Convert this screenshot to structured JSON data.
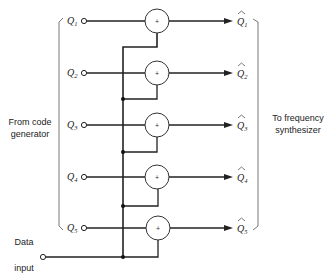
{
  "diagram": {
    "left_caption": {
      "line1": "From code",
      "line2": "generator"
    },
    "right_caption": {
      "line1": "To frequency",
      "line2": "synthesizer"
    },
    "data_input": {
      "line1": "Data",
      "line2": "input"
    },
    "adder_symbol": "+",
    "inputs": [
      {
        "base": "Q",
        "sub": "1"
      },
      {
        "base": "Q",
        "sub": "2"
      },
      {
        "base": "Q",
        "sub": "3"
      },
      {
        "base": "Q",
        "sub": "4"
      },
      {
        "base": "Q",
        "sub": "5"
      }
    ],
    "outputs": [
      {
        "base": "Q",
        "sub": "1",
        "hat": "^"
      },
      {
        "base": "Q",
        "sub": "2",
        "hat": "^"
      },
      {
        "base": "Q",
        "sub": "3",
        "hat": "^"
      },
      {
        "base": "Q",
        "sub": "4",
        "hat": "^"
      },
      {
        "base": "Q",
        "sub": "5",
        "hat": "^"
      }
    ]
  }
}
